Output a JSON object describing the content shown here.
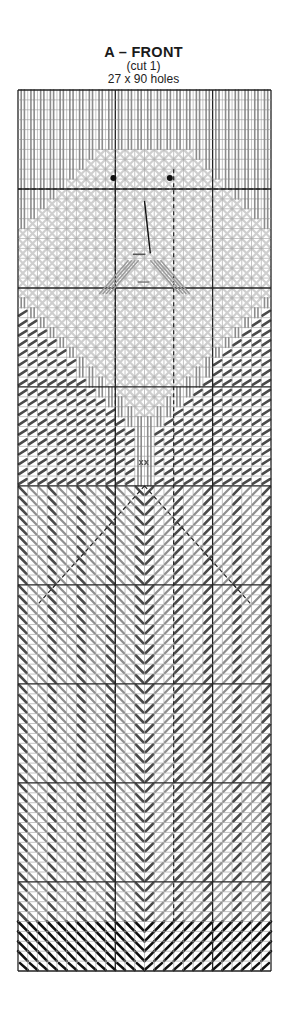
{
  "header": {
    "title": "A – FRONT",
    "cut_note": "(cut 1)",
    "size_note": "27 x 90 holes"
  },
  "chart_data": {
    "type": "needlepoint-chart",
    "title": "A – FRONT",
    "subtitle": "(cut 1)",
    "dimensions": {
      "holes_wide": 27,
      "holes_high": 90
    },
    "grid": {
      "left": 18,
      "top": 90,
      "right": 271,
      "bottom": 971,
      "heavy_line_every": 10,
      "centerlines": {
        "vertical_dashed_at_cols": [
          10,
          16
        ],
        "horizontal_dashed_at_rows": [
          10,
          30,
          40
        ]
      }
    },
    "colors": {
      "grid_line": "#9a9a9a",
      "heavy_line": "#222222",
      "hair_beard": "#8c8c8c",
      "face_skin": "#cfcfcf",
      "robe_dark": "#4a4a4a",
      "robe_medium": "#8f8f8f",
      "hem_black": "#111111",
      "eyes": "#111111"
    },
    "regions": [
      {
        "name": "hair",
        "stitch": "vertical long",
        "color": "hair_beard",
        "rows": [
          0,
          40
        ]
      },
      {
        "name": "face",
        "stitch": "cross/tent",
        "color": "face_skin",
        "rows": [
          6,
          33
        ]
      },
      {
        "name": "beard",
        "stitch": "vertical long",
        "color": "hair_beard",
        "rows": [
          16,
          40
        ]
      },
      {
        "name": "shoulders",
        "stitch": "slanted tent",
        "color": "robe_dark",
        "rows": [
          22,
          42
        ]
      },
      {
        "name": "robe",
        "stitch": "alternating slanted columns, mirrored at center",
        "colors": [
          "robe_dark",
          "robe_medium"
        ],
        "rows": [
          40,
          84
        ]
      },
      {
        "name": "hem",
        "stitch": "slanted long, chevron",
        "color": "hem_black",
        "rows": [
          84,
          89
        ]
      }
    ],
    "features": {
      "eyes": [
        {
          "col": 9.8,
          "row": 8.9
        },
        {
          "col": 15.6,
          "row": 8.9
        }
      ],
      "nose_line": {
        "from": [
          13.0,
          11.2
        ],
        "to": [
          13.6,
          16.5
        ]
      },
      "mouth": {
        "from": [
          11.8,
          16.6
        ],
        "to": [
          13.1,
          16.6
        ]
      },
      "belt_buckle": {
        "col": 13.0,
        "row": 37.5
      }
    }
  }
}
